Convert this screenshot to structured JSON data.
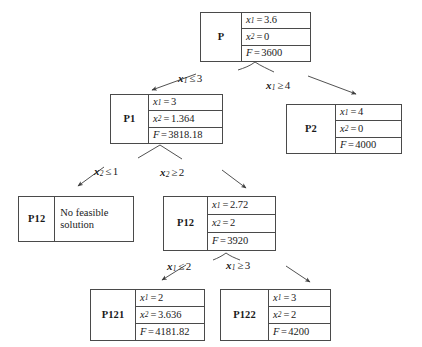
{
  "diagram": {
    "type": "branch-and-bound-tree",
    "title": "",
    "nodes": [
      {
        "id": "P",
        "name": "P",
        "level": 0,
        "rows": [
          {
            "label": "x1",
            "value": "3.6",
            "text": "x₁ = 3.6"
          },
          {
            "label": "x2",
            "value": "0",
            "text": "x₂ = 0"
          },
          {
            "label": "F",
            "value": "3600",
            "text": "F = 3600"
          }
        ],
        "note": ""
      },
      {
        "id": "P1",
        "name": "P1",
        "level": 1,
        "rows": [
          {
            "label": "x1",
            "value": "3",
            "text": "x₁ = 3"
          },
          {
            "label": "x2",
            "value": "1.364",
            "text": "x₂ = 1.364"
          },
          {
            "label": "F",
            "value": "3818.18",
            "text": "F = 3818.18"
          }
        ],
        "note": ""
      },
      {
        "id": "P2",
        "name": "P2",
        "level": 1,
        "rows": [
          {
            "label": "x1",
            "value": "4",
            "text": "x₁ = 4"
          },
          {
            "label": "x2",
            "value": "0",
            "text": "x₂ = 0"
          },
          {
            "label": "F",
            "value": "4000",
            "text": "F = 4000"
          }
        ],
        "note": ""
      },
      {
        "id": "P11",
        "name": "P12",
        "level": 2,
        "rows": [],
        "note": "No feasible solution"
      },
      {
        "id": "P12",
        "name": "P12",
        "level": 2,
        "rows": [
          {
            "label": "x1",
            "value": "2.72",
            "text": "x₁ = 2.72"
          },
          {
            "label": "x2",
            "value": "2",
            "text": "x₂ = 2"
          },
          {
            "label": "F",
            "value": "3920",
            "text": "F = 3920"
          }
        ],
        "note": ""
      },
      {
        "id": "P121",
        "name": "P121",
        "level": 3,
        "rows": [
          {
            "label": "x1",
            "value": "2",
            "text": "x₁ = 2"
          },
          {
            "label": "x2",
            "value": "3.636",
            "text": "x₂ = 3.636"
          },
          {
            "label": "F",
            "value": "4181.82",
            "text": "F = 4181.82"
          }
        ],
        "note": ""
      },
      {
        "id": "P122",
        "name": "P122",
        "level": 3,
        "rows": [
          {
            "label": "x1",
            "value": "3",
            "text": "x₁ = 3"
          },
          {
            "label": "x2",
            "value": "2",
            "text": "x₂ = 2"
          },
          {
            "label": "F",
            "value": "4200",
            "text": "F = 4200"
          }
        ],
        "note": ""
      }
    ],
    "branch_labels": [
      {
        "id": "b-p-left",
        "from": "P",
        "to": "P1",
        "text": "x₁ ≤ 3"
      },
      {
        "id": "b-p-right",
        "from": "P",
        "to": "P2",
        "text": "x₁ ≥ 4"
      },
      {
        "id": "b-p1-left",
        "from": "P1",
        "to": "P11",
        "text": "x₂ ≤ 1"
      },
      {
        "id": "b-p1-right",
        "from": "P1",
        "to": "P12",
        "text": "x₂ ≥ 2"
      },
      {
        "id": "b-p12-left",
        "from": "P12",
        "to": "P121",
        "text": "x₁ ≤ 2"
      },
      {
        "id": "b-p12-right",
        "from": "P12",
        "to": "P122",
        "text": "x₁ ≥ 3"
      }
    ],
    "colors": {
      "background": "#ffffff",
      "border": "#4a4a4a",
      "text": "#1a1a1a",
      "edge": "#3d3d3d"
    }
  }
}
